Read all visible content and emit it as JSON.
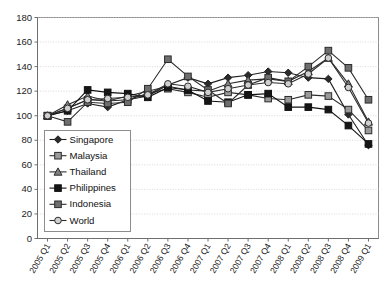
{
  "chart_data": {
    "type": "line",
    "title": "",
    "subtitle": "",
    "xlabel": "",
    "ylabel": "",
    "ylim": [
      0,
      180
    ],
    "ytick_step": 20,
    "yticks": [
      0,
      20,
      40,
      60,
      80,
      100,
      120,
      140,
      160,
      180
    ],
    "grid": true,
    "legend_position": "inside-bottom-left",
    "categories": [
      "2005 Q1",
      "2005 Q2",
      "2005 Q3",
      "2005 Q4",
      "2006 Q1",
      "2006 Q2",
      "2006 Q3",
      "2006 Q4",
      "2007 Q1",
      "2007 Q2",
      "2007 Q3",
      "2007 Q4",
      "2008 Q1",
      "2008 Q2",
      "2008 Q3",
      "2008 Q4",
      "2009 Q1"
    ],
    "series": [
      {
        "name": "Singapore",
        "marker": "diamond",
        "color": "#1f1f1f",
        "fill": "#2b2b2b",
        "values": [
          100,
          104,
          110,
          107,
          113,
          116,
          125,
          131,
          126,
          131,
          133,
          136,
          135,
          131,
          130,
          101,
          76
        ]
      },
      {
        "name": "Malaysia",
        "marker": "square",
        "color": "#2b2b2b",
        "fill": "#9a9a9a",
        "values": [
          100,
          106,
          113,
          112,
          113,
          118,
          122,
          119,
          115,
          119,
          117,
          114,
          113,
          117,
          116,
          105,
          88
        ]
      },
      {
        "name": "Thailand",
        "marker": "triangle",
        "color": "#2b2b2b",
        "fill": "#808080",
        "values": [
          100,
          109,
          116,
          112,
          116,
          120,
          124,
          121,
          120,
          126,
          129,
          130,
          128,
          136,
          147,
          126,
          95
        ]
      },
      {
        "name": "Philippines",
        "marker": "square",
        "color": "#111111",
        "fill": "#161616",
        "values": [
          100,
          104,
          121,
          119,
          118,
          115,
          123,
          121,
          112,
          111,
          117,
          118,
          107,
          107,
          105,
          92,
          77
        ]
      },
      {
        "name": "Indonesia",
        "marker": "square",
        "color": "#2b2b2b",
        "fill": "#6e6e6e",
        "values": [
          100,
          95,
          111,
          110,
          111,
          122,
          146,
          132,
          121,
          110,
          125,
          131,
          128,
          140,
          153,
          139,
          113
        ]
      },
      {
        "name": "World",
        "marker": "circle",
        "color": "#2b2b2b",
        "fill": "#cfcfcf",
        "values": [
          100,
          106,
          113,
          114,
          115,
          117,
          126,
          124,
          119,
          122,
          125,
          127,
          126,
          134,
          147,
          123,
          94
        ]
      }
    ]
  },
  "legend": {
    "items": [
      {
        "label": "Singapore"
      },
      {
        "label": "Malaysia"
      },
      {
        "label": "Thailand"
      },
      {
        "label": "Philippines"
      },
      {
        "label": "Indonesia"
      },
      {
        "label": "World"
      }
    ]
  }
}
